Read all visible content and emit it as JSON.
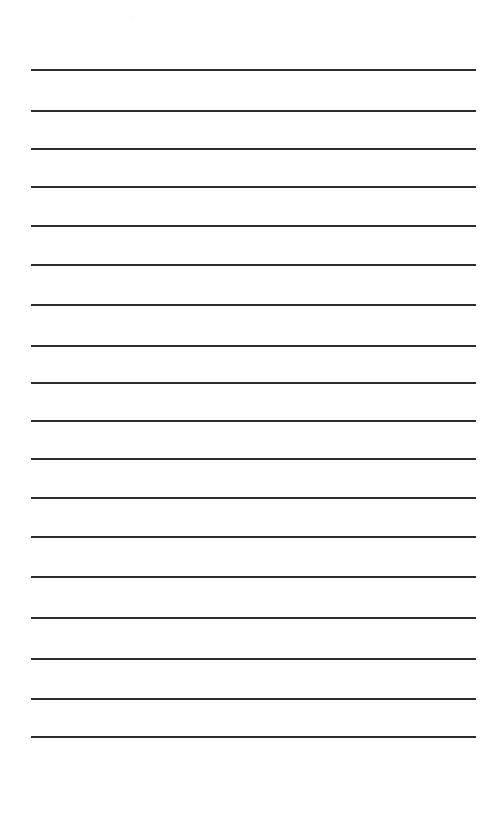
{
  "document": {
    "type": "lined-paper",
    "title": "Blank Ruled Notepad Page",
    "page_width": 488,
    "page_height": 824,
    "background_color": "#ffffff",
    "text_content": "",
    "has_visible_text": false
  },
  "ruling": {
    "line_count": 18,
    "line_color": "#2b2b2b",
    "line_thickness_px": 2,
    "left_margin_px": 31,
    "right_margin_px": 476,
    "line_length_px": 445,
    "first_line_y_px": 69,
    "last_line_y_px": 774,
    "average_spacing_px": 41,
    "line_positions_y": [
      69,
      110,
      148,
      186,
      225,
      264,
      304,
      345,
      382,
      420,
      458,
      497,
      536,
      576,
      617,
      658,
      698,
      736,
      774
    ],
    "line_style": "solid"
  },
  "artifacts": {
    "scan_mark": {
      "label": "faint-scan-artifact",
      "x_px": 130,
      "y_px": 16,
      "color": "#fdfdfd"
    }
  },
  "accessibility": {
    "page_description": "Blank lined writing paper with horizontal ruled lines and no written content"
  }
}
